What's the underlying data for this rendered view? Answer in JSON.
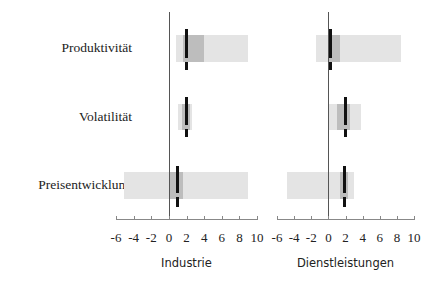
{
  "chart_data": [
    {
      "type": "bar",
      "subtype": "range-bar-with-marker",
      "title": "Industrie",
      "xlabel": "Industrie",
      "categories": [
        "Produktivität",
        "Volatilität",
        "Preisentwicklung"
      ],
      "xlim": [
        -6,
        10
      ],
      "xticks": [
        -6,
        -4,
        -2,
        0,
        2,
        4,
        6,
        8,
        10
      ],
      "series": [
        {
          "name": "outer range (light)",
          "color": "#e4e4e4",
          "ranges": [
            [
              0.8,
              9.0
            ],
            [
              1.0,
              2.6
            ],
            [
              -5.1,
              9.0
            ]
          ]
        },
        {
          "name": "inner range (dark)",
          "color": "#bdbdbd",
          "ranges": [
            [
              1.6,
              4.0
            ],
            [
              1.5,
              2.4
            ],
            [
              0.0,
              1.6
            ]
          ]
        },
        {
          "name": "marker",
          "color": "#111111",
          "values": [
            2.0,
            2.0,
            1.0
          ]
        }
      ],
      "grid": false
    },
    {
      "type": "bar",
      "subtype": "range-bar-with-marker",
      "title": "Dienstleistungen",
      "xlabel": "Dienstleistungen",
      "categories": [
        "Produktivität",
        "Volatilität",
        "Preisentwicklung"
      ],
      "xlim": [
        -6,
        10
      ],
      "xticks": [
        -6,
        -4,
        -2,
        0,
        2,
        4,
        6,
        8,
        10
      ],
      "series": [
        {
          "name": "outer range (light)",
          "color": "#e4e4e4",
          "ranges": [
            [
              -1.5,
              8.5
            ],
            [
              0.0,
              3.8
            ],
            [
              -4.8,
              3.0
            ]
          ]
        },
        {
          "name": "inner range (dark)",
          "color": "#bdbdbd",
          "ranges": [
            [
              0.0,
              1.3
            ],
            [
              1.0,
              2.5
            ],
            [
              1.3,
              2.3
            ]
          ]
        },
        {
          "name": "marker",
          "color": "#111111",
          "values": [
            0.2,
            2.0,
            1.9
          ]
        }
      ],
      "grid": false
    }
  ],
  "labels": {
    "rows": [
      "Produktivität",
      "Volatilität",
      "Preisentwicklung"
    ],
    "panels": [
      "Industrie",
      "Dienstleistungen"
    ],
    "ticks": [
      "-6",
      "-4",
      "-2",
      "0",
      "2",
      "4",
      "6",
      "8",
      "10"
    ]
  }
}
